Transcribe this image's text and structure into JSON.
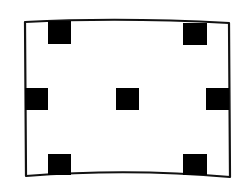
{
  "diagram": {
    "colors": {
      "stroke": "#111111",
      "fill": "#000000",
      "background": "#ffffff"
    },
    "frame": {
      "path": "M25,22 Q120,17 229,23 L230,177 Q130,168 26,176 Z"
    },
    "squares": [
      {
        "name": "top-left",
        "x": 48,
        "y": 21,
        "w": 23,
        "h": 23
      },
      {
        "name": "top-right",
        "x": 183,
        "y": 23,
        "w": 24,
        "h": 22
      },
      {
        "name": "middle-left",
        "x": 25,
        "y": 88,
        "w": 23,
        "h": 22
      },
      {
        "name": "center",
        "x": 116,
        "y": 88,
        "w": 23,
        "h": 22
      },
      {
        "name": "middle-right",
        "x": 206,
        "y": 88,
        "w": 23,
        "h": 22
      },
      {
        "name": "bottom-left",
        "x": 48,
        "y": 154,
        "w": 23,
        "h": 21
      },
      {
        "name": "bottom-right",
        "x": 183,
        "y": 154,
        "w": 24,
        "h": 21
      }
    ]
  }
}
